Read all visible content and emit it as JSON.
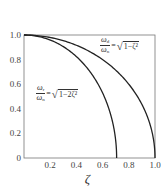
{
  "chart_data": {
    "type": "line",
    "title": "",
    "xlabel": "ζ",
    "ylabel": "",
    "xlim": [
      0,
      1.0
    ],
    "ylim": [
      0,
      1.0
    ],
    "grid": false,
    "x_ticks": [
      "0.2",
      "0.4",
      "0.6",
      "0.8",
      "1.0"
    ],
    "y_ticks": [
      "0",
      "0.2",
      "0.4",
      "0.6",
      "0.8",
      "1.0"
    ],
    "series": [
      {
        "name": "ωd/ωn = √(1−ζ²)",
        "x": [
          0,
          0.1,
          0.2,
          0.3,
          0.4,
          0.5,
          0.6,
          0.7,
          0.8,
          0.9,
          0.95,
          0.99,
          1.0
        ],
        "values": [
          1.0,
          0.995,
          0.98,
          0.954,
          0.917,
          0.866,
          0.8,
          0.714,
          0.6,
          0.436,
          0.312,
          0.141,
          0.0
        ]
      },
      {
        "name": "ωr/ωn = √(1−2ζ²)",
        "x": [
          0,
          0.1,
          0.2,
          0.3,
          0.4,
          0.5,
          0.6,
          0.65,
          0.69,
          0.707
        ],
        "values": [
          1.0,
          0.99,
          0.959,
          0.906,
          0.825,
          0.707,
          0.529,
          0.394,
          0.217,
          0.0
        ]
      }
    ],
    "annotations": [
      {
        "text": "ωd/ωn = √(1−ζ²)",
        "position": "upper right"
      },
      {
        "text": "ωr/ωn = √(1−2ζ²)",
        "position": "middle left"
      }
    ]
  },
  "annotations": {
    "damped": {
      "num": "ω",
      "num_sub": "d",
      "den": "ω",
      "den_sub": "n",
      "eq": "=",
      "radicand": "1−ζ²"
    },
    "resonant": {
      "num": "ω",
      "num_sub": "r",
      "den": "ω",
      "den_sub": "n",
      "eq": "=",
      "radicand": "1−2ζ²"
    }
  }
}
